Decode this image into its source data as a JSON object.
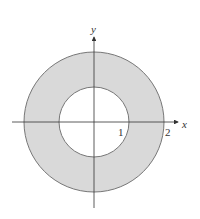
{
  "diagram": {
    "type": "annulus",
    "inner_radius": 1,
    "outer_radius": 2,
    "axis_labels": {
      "x": "x",
      "y": "y"
    },
    "tick_labels": {
      "one": "1",
      "two": "2"
    },
    "colors": {
      "fill": "#d9d9d9",
      "stroke": "#777777",
      "axis": "#333333"
    }
  }
}
